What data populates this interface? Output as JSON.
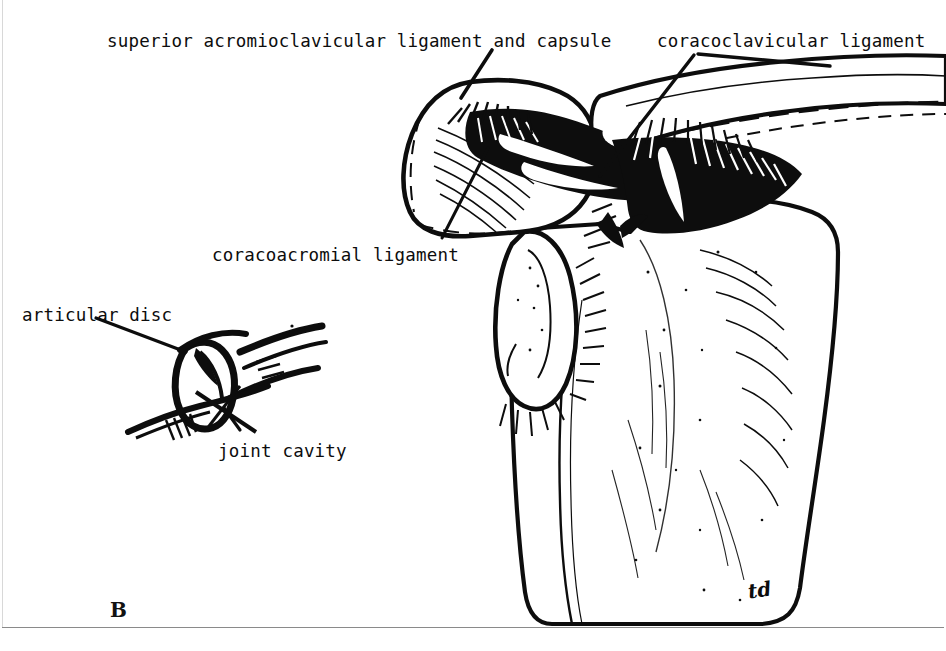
{
  "figure": {
    "letter": "B",
    "signature": "td",
    "caption_type": "anatomical-line-drawing"
  },
  "labels": [
    {
      "id": "superior-acromioclavicular",
      "text": "superior acromioclavicular ligament and capsule",
      "x": 107,
      "y": 33
    },
    {
      "id": "coracoclavicular",
      "text": "coracoclavicular ligament",
      "x": 657,
      "y": 33
    },
    {
      "id": "coracoacromial",
      "text": "coracoacromial ligament",
      "x": 212,
      "y": 247
    },
    {
      "id": "articular-disc",
      "text": "articular disc",
      "x": 22,
      "y": 307
    },
    {
      "id": "joint-cavity",
      "text": "joint cavity",
      "x": 218,
      "y": 443
    }
  ],
  "colors": {
    "ink": "#0d0d0d",
    "paper": "#ffffff",
    "rule": "#8a8a8a"
  }
}
